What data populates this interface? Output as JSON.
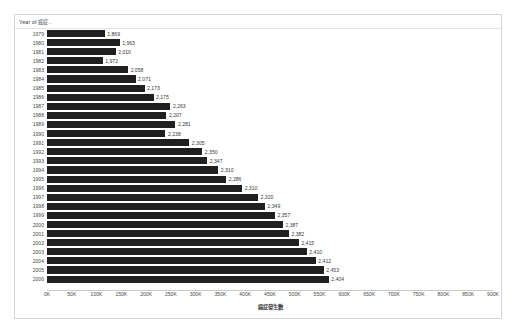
{
  "card": {
    "field_header_label": "Year of 癌症..",
    "bar_color": "#1f1f1f",
    "frame_color": "#d4d4d4",
    "background": "#ffffff"
  },
  "chart_data": {
    "type": "bar",
    "orientation": "horizontal",
    "title": "",
    "xlabel": "癌症發生數",
    "ylabel": "Year of 癌症..",
    "xlim": [
      0,
      900000
    ],
    "grid": false,
    "legend": null,
    "axis_ticks": [
      "0K",
      "50K",
      "100K",
      "150K",
      "200K",
      "250K",
      "300K",
      "350K",
      "400K",
      "450K",
      "500K",
      "550K",
      "600K",
      "650K",
      "700K",
      "750K",
      "800K",
      "850K",
      "900K"
    ],
    "axis_tick_values": [
      0,
      50000,
      100000,
      150000,
      200000,
      250000,
      300000,
      350000,
      400000,
      450000,
      500000,
      550000,
      600000,
      650000,
      700000,
      750000,
      800000,
      850000,
      900000
    ],
    "categories": [
      "1979",
      "1980",
      "1981",
      "1982",
      "1983",
      "1984",
      "1985",
      "1986",
      "1987",
      "1988",
      "1989",
      "1990",
      "1991",
      "1992",
      "1993",
      "1994",
      "1995",
      "1996",
      "1997",
      "1998",
      "1999",
      "2000",
      "2001",
      "2002",
      "2003",
      "2004",
      "2005",
      "2006"
    ],
    "labels": [
      "1,869",
      "1,963",
      "2,010",
      "1,972",
      "2,058",
      "2,071",
      "2,173",
      "2,175",
      "2,263",
      "2,207",
      "2,281",
      "2,238",
      "2,305",
      "2,350",
      "2,347",
      "2,310",
      "2,286",
      "2,310",
      "2,320",
      "2,349",
      "2,357",
      "2,387",
      "2,382",
      "2,415",
      "2,410",
      "2,412",
      "2,453",
      "2,404"
    ],
    "values": [
      116000,
      146000,
      138000,
      112000,
      163000,
      178000,
      196000,
      214000,
      248000,
      240000,
      258000,
      238000,
      286000,
      312000,
      322000,
      344000,
      360000,
      392000,
      424000,
      438000,
      458000,
      474000,
      486000,
      506000,
      522000,
      540000,
      556000,
      566000
    ]
  }
}
